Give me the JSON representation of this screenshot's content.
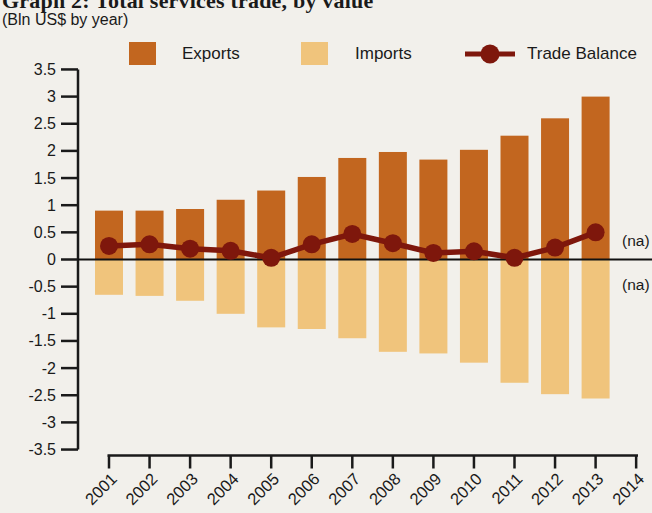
{
  "title": "Graph 2: Total services trade, by value",
  "subtitle": "(Bln US$ by year)",
  "colors": {
    "title": "#9E3A20",
    "exports": "#C2661F",
    "imports": "#F0C47C",
    "trade_balance": "#7E170C",
    "axis": "#1A1A1A",
    "background": "#F2F0EB"
  },
  "legend": {
    "items": [
      {
        "label": "Exports",
        "marker": "square",
        "series": "exports"
      },
      {
        "label": "Imports",
        "marker": "square",
        "series": "imports"
      },
      {
        "label": "Trade Balance",
        "marker": "line-dot",
        "series": "trade_balance"
      }
    ]
  },
  "chart_data": {
    "type": "bar",
    "combo": "bar+line",
    "title": "Graph 2: Total services trade, by value",
    "ylabel": "Bln US$ by year",
    "categories": [
      "2001",
      "2002",
      "2003",
      "2004",
      "2005",
      "2006",
      "2007",
      "2008",
      "2009",
      "2010",
      "2011",
      "2012",
      "2013",
      "2014"
    ],
    "series": [
      {
        "name": "Exports",
        "type": "bar",
        "values": [
          0.9,
          0.9,
          0.93,
          1.1,
          1.27,
          1.52,
          1.87,
          1.98,
          1.84,
          2.02,
          2.28,
          2.6,
          3.0,
          null
        ]
      },
      {
        "name": "Imports",
        "type": "bar",
        "values": [
          -0.65,
          -0.67,
          -0.76,
          -1.0,
          -1.25,
          -1.28,
          -1.45,
          -1.7,
          -1.73,
          -1.9,
          -2.27,
          -2.48,
          -2.56,
          null
        ]
      },
      {
        "name": "Trade Balance",
        "type": "line",
        "values": [
          0.25,
          0.28,
          0.2,
          0.16,
          0.03,
          0.28,
          0.47,
          0.3,
          0.12,
          0.15,
          0.03,
          0.22,
          0.5,
          null
        ]
      }
    ],
    "ylim": [
      -3.5,
      3.5
    ],
    "ytick_step": 0.5,
    "yticks": [
      "3.5",
      "3",
      "2.5",
      "2",
      "1.5",
      "1",
      "0.5",
      "0",
      "-0.5",
      "-1",
      "-1.5",
      "-2",
      "-2.5",
      "-3",
      "-3.5"
    ],
    "grid": false,
    "legend_position": "top",
    "na_label": "(na)",
    "annotations": [
      "(na)",
      "(na)"
    ]
  }
}
